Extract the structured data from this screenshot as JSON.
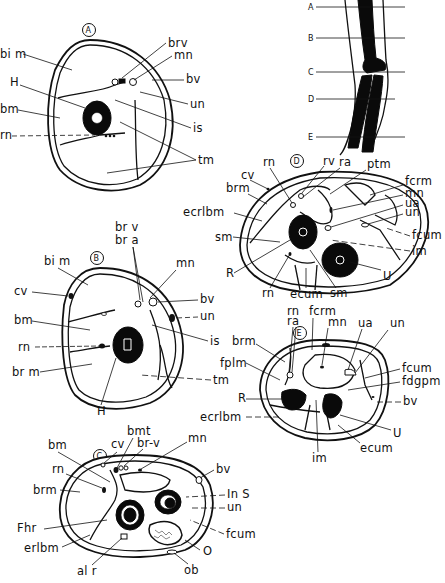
{
  "figure": {
    "reference_limb": {
      "levels": [
        "A",
        "B",
        "C",
        "D",
        "E"
      ]
    },
    "sections": {
      "A": {
        "marker": "A",
        "labels": {
          "bim": "bi m",
          "H": "H",
          "bm": "bm",
          "rn": "rn",
          "brv": "brv",
          "mn": "mn",
          "bv": "bv",
          "un": "un",
          "is": "is",
          "tm": "tm"
        }
      },
      "B": {
        "marker": "B",
        "labels": {
          "brv": "br v",
          "bra": "br a",
          "bim": "bi m",
          "mn": "mn",
          "cv": "cv",
          "bv": "bv",
          "bm": "bm",
          "un": "un",
          "rn": "rn",
          "is": "is",
          "brm": "br m",
          "tm": "tm",
          "H": "H"
        }
      },
      "C": {
        "marker": "C",
        "labels": {
          "bmt": "bmt",
          "brv": "br-v",
          "bm": "bm",
          "cv": "cv",
          "mn": "mn",
          "rn": "rn",
          "bv": "bv",
          "brm": "brm",
          "InS": "In S",
          "un": "un",
          "Fhr": "Fhr",
          "fcum": "fcum",
          "erlbm": "erlbm",
          "O": "O",
          "alr": "al r",
          "ob": "ob"
        }
      },
      "D": {
        "marker": "D",
        "labels": {
          "rn_top": "rn",
          "rv": "rv",
          "ra": "ra",
          "ptm": "ptm",
          "cv": "cv",
          "brm": "brm",
          "fcrm": "fcrm",
          "mn": "mn",
          "ecrlbm": "ecrlbm",
          "ua": "ua",
          "un": "un",
          "sm_left": "sm",
          "fcum": "fcum",
          "im": "im",
          "R": "R",
          "U": "U",
          "rn_bottom": "rn",
          "ecum": "ecum",
          "sm_bottom": "sm"
        }
      },
      "E": {
        "marker": "E",
        "labels": {
          "rn": "rn",
          "ra": "ra",
          "fcrm": "fcrm",
          "mn": "mn",
          "ua": "ua",
          "un": "un",
          "brm": "brm",
          "fplm": "fplm",
          "fcum": "fcum",
          "fdgpm": "fdgpm",
          "R": "R",
          "bv": "bv",
          "ecrlbm": "ecrlbm",
          "U": "U",
          "ecum": "ecum",
          "im": "im"
        }
      }
    }
  }
}
